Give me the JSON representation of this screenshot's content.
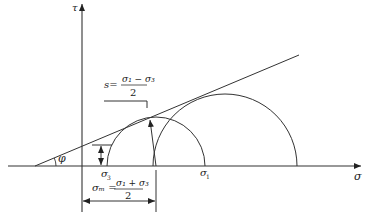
{
  "diagram": {
    "axes": {
      "vertical_label": "τ",
      "horizontal_label": "σ"
    },
    "angle_label": "φ",
    "points": {
      "sigma3_label": "σ",
      "sigma3_sub": "3",
      "sigma1_label": "σ",
      "sigma1_sub": "1"
    },
    "radius_formula": {
      "lhs": "s=",
      "numerator": "σ₁ − σ₃",
      "denominator": "2"
    },
    "center_formula": {
      "lhs": "σₘ =",
      "numerator": "σ₁ + σ₃",
      "denominator": "2"
    },
    "colors": {
      "line": "#333333",
      "background": "#ffffff"
    }
  }
}
